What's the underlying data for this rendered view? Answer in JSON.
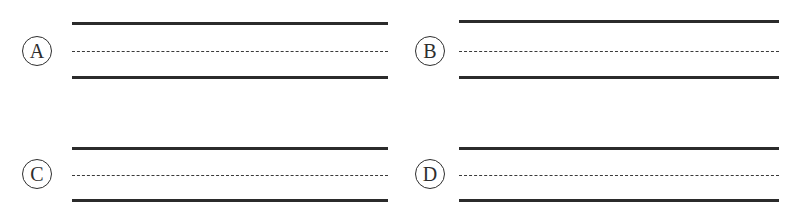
{
  "figure": {
    "background_color": "#ffffff",
    "line_color": "#2b2b2b",
    "dash_color": "#3a3a3a",
    "label_color": "#2e2e2e",
    "width": 800,
    "height": 212
  },
  "panels": [
    {
      "id": "a",
      "label": "A",
      "label_shape": "circle",
      "label_x": 22,
      "label_y": 36,
      "label_size": 30,
      "lane_x": 72,
      "lane_width": 316,
      "top_line_y": 22,
      "dashed_line_y": 51,
      "bottom_line_y": 76,
      "lines": [
        {
          "style": "solid",
          "name": "upper-edge-line"
        },
        {
          "style": "dashed",
          "name": "center-divider-line"
        },
        {
          "style": "solid",
          "name": "lower-edge-line"
        }
      ]
    },
    {
      "id": "b",
      "label": "B",
      "label_shape": "circle",
      "label_x": 415,
      "label_y": 36,
      "label_size": 30,
      "lane_x": 459,
      "lane_width": 320,
      "top_line_y": 20,
      "dashed_line_y": 51,
      "bottom_line_y": 76,
      "lines": [
        {
          "style": "solid",
          "name": "upper-edge-line"
        },
        {
          "style": "dashed",
          "name": "center-divider-line"
        },
        {
          "style": "solid",
          "name": "lower-edge-line"
        }
      ]
    },
    {
      "id": "c",
      "label": "C",
      "label_shape": "circle",
      "label_x": 22,
      "label_y": 159,
      "label_size": 30,
      "lane_x": 72,
      "lane_width": 316,
      "top_line_y": 147,
      "dashed_line_y": 175,
      "bottom_line_y": 199,
      "lines": [
        {
          "style": "solid",
          "name": "upper-edge-line"
        },
        {
          "style": "dashed",
          "name": "center-divider-line"
        },
        {
          "style": "solid",
          "name": "lower-edge-line"
        }
      ]
    },
    {
      "id": "d",
      "label": "D",
      "label_shape": "circle",
      "label_x": 415,
      "label_y": 159,
      "label_size": 30,
      "lane_x": 459,
      "lane_width": 320,
      "top_line_y": 147,
      "dashed_line_y": 175,
      "bottom_line_y": 199,
      "lines": [
        {
          "style": "solid",
          "name": "upper-edge-line"
        },
        {
          "style": "dashed",
          "name": "center-divider-line"
        },
        {
          "style": "solid",
          "name": "lower-edge-line"
        }
      ]
    }
  ]
}
